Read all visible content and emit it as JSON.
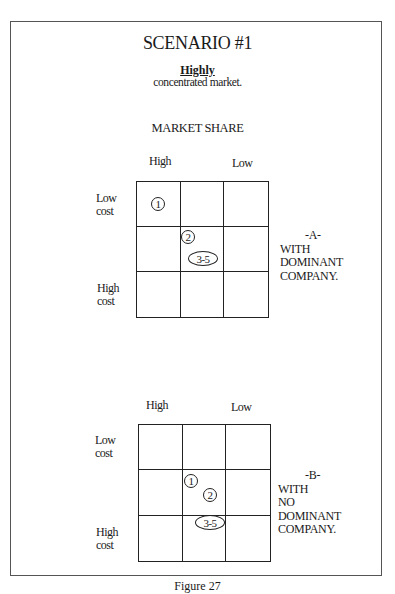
{
  "title": "SCENARIO #1",
  "subtitle": {
    "emphasis": "Highly",
    "text": "concentrated market."
  },
  "axis_title": "MARKET SHARE",
  "diagrams": [
    {
      "id": "A",
      "col_labels": {
        "left": "High",
        "right": "Low"
      },
      "row_labels": {
        "top_line1": "Low",
        "top_line2": "cost",
        "bottom_line1": "High",
        "bottom_line2": "cost"
      },
      "markers": [
        {
          "label": "1",
          "shape": "circle",
          "cell": "row1-col1"
        },
        {
          "label": "2",
          "shape": "circle",
          "cell": "row2-col2-topleft"
        },
        {
          "label": "3-5",
          "shape": "ellipse",
          "cell": "row2-col2"
        }
      ],
      "side_label": {
        "letter": "-A-",
        "line1": "WITH",
        "line2": "DOMINANT",
        "line3": "COMPANY."
      }
    },
    {
      "id": "B",
      "col_labels": {
        "left": "High",
        "right": "Low"
      },
      "row_labels": {
        "top_line1": "Low",
        "top_line2": "cost",
        "bottom_line1": "High",
        "bottom_line2": "cost"
      },
      "markers": [
        {
          "label": "1",
          "shape": "circle",
          "cell": "row2-col2-topleft"
        },
        {
          "label": "2",
          "shape": "circle",
          "cell": "row2-col2"
        },
        {
          "label": "3-5",
          "shape": "ellipse",
          "cell": "row3-col2-top"
        }
      ],
      "side_label": {
        "letter": "-B-",
        "line1": "WITH",
        "line2": "NO",
        "line3": "DOMINANT",
        "line4": "COMPANY."
      }
    }
  ],
  "caption": "Figure 27"
}
